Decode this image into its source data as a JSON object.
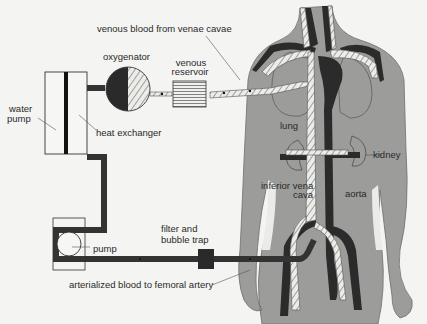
{
  "colors": {
    "background": "#f4f4f2",
    "body": "#9c9c9a",
    "body_outline": "#6e6e6c",
    "venous_vessel": "#e6e6e2",
    "arterial_vessel": "#2b2b2b",
    "tubing": "#333333",
    "line": "#555555"
  },
  "labels": {
    "venous_blood": "venous blood from venae cavae",
    "oxygenator": "oxygenator",
    "venous_reservoir_1": "venous",
    "venous_reservoir_2": "reservoir",
    "water_pump_1": "water",
    "water_pump_2": "pump",
    "heat_exchanger": "heat exchanger",
    "lung": "lung",
    "kidney": "kidney",
    "inferior_vena_cava_1": "inferior vena",
    "inferior_vena_cava_2": "cava",
    "aorta": "aorta",
    "pump": "pump",
    "filter_1": "filter and",
    "filter_2": "bubble trap",
    "arterialized_blood": "arterialized blood to femoral artery"
  },
  "components": [
    {
      "id": "water-pump",
      "label": "water pump"
    },
    {
      "id": "heat-exchanger",
      "label": "heat exchanger"
    },
    {
      "id": "oxygenator",
      "label": "oxygenator"
    },
    {
      "id": "venous-reservoir",
      "label": "venous reservoir"
    },
    {
      "id": "pump",
      "label": "pump"
    },
    {
      "id": "filter-bubble-trap",
      "label": "filter and bubble trap"
    }
  ],
  "anatomy": [
    {
      "id": "lung",
      "label": "lung"
    },
    {
      "id": "kidney",
      "label": "kidney"
    },
    {
      "id": "inferior-vena-cava",
      "label": "inferior vena cava"
    },
    {
      "id": "aorta",
      "label": "aorta"
    }
  ]
}
